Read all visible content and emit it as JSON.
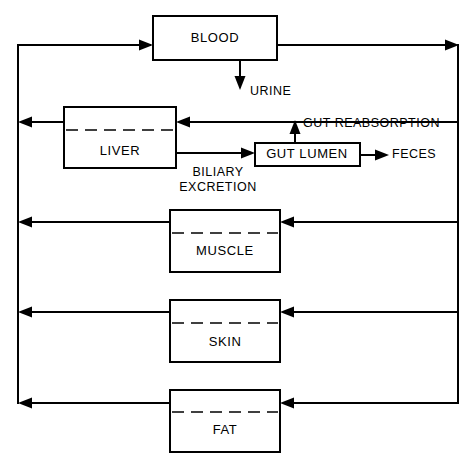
{
  "diagram": {
    "type": "pharmacokinetic-compartment-flow-diagram",
    "accent_color": "#000000",
    "background_color": "#ffffff",
    "compartments": [
      {
        "id": "blood",
        "label": "BLOOD",
        "x": 153,
        "y": 16,
        "w": 124,
        "h": 44,
        "dashed_divider": false,
        "divider_y": 0,
        "label_x": 215,
        "label_y": 38
      },
      {
        "id": "liver",
        "label": "LIVER",
        "x": 64,
        "y": 107,
        "w": 112,
        "h": 61,
        "dashed_divider": true,
        "divider_y": 130,
        "label_x": 120,
        "label_y": 152
      },
      {
        "id": "gut_lumen",
        "label": "GUT LUMEN",
        "x": 255,
        "y": 143,
        "w": 105,
        "h": 23,
        "dashed_divider": false,
        "divider_y": 0,
        "label_x": 307,
        "label_y": 155
      },
      {
        "id": "muscle",
        "label": "MUSCLE",
        "x": 170,
        "y": 210,
        "w": 110,
        "h": 62,
        "dashed_divider": true,
        "divider_y": 233,
        "label_x": 225,
        "label_y": 252
      },
      {
        "id": "skin",
        "label": "SKIN",
        "x": 170,
        "y": 300,
        "w": 110,
        "h": 62,
        "dashed_divider": true,
        "divider_y": 323,
        "label_x": 225,
        "label_y": 343
      },
      {
        "id": "fat",
        "label": "FAT",
        "x": 170,
        "y": 390,
        "w": 110,
        "h": 62,
        "dashed_divider": true,
        "divider_y": 412,
        "label_x": 225,
        "label_y": 431
      }
    ],
    "flow_labels": [
      {
        "id": "urine",
        "text": "URINE",
        "x": 250,
        "y": 91,
        "anchor": "start"
      },
      {
        "id": "gut_reabsorption",
        "text": "GUT REABSORPTION",
        "x": 303,
        "y": 124,
        "anchor": "start"
      },
      {
        "id": "feces",
        "text": "FECES",
        "x": 392,
        "y": 155,
        "anchor": "start"
      },
      {
        "id": "biliary_line_1",
        "text": "BILIARY",
        "x": 218,
        "y": 172,
        "anchor": "middle"
      },
      {
        "id": "biliary_line_2",
        "text": "EXCRETION",
        "x": 218,
        "y": 187,
        "anchor": "middle"
      }
    ],
    "connector_paths": {
      "blood_out_right": "M 277 45 L 458 45",
      "right_bus_down": "M 458 45 L 458 403",
      "left_bus_down": "M 18 45 L 18 403",
      "left_bus_to_blood": "M 18 45 L 153 45",
      "liver_return_left": "M 176 122 L 18 122",
      "liver_in_from_right": "M 176 122 L 458 122",
      "biliary_excretion": "M 176 153 L 255 153",
      "biliary_stub_down": "M 176 122 L 176 153",
      "gut_reabsorption_up": "M 295 143 L 295 122",
      "feces_out": "M 360 155 L 388 155",
      "urine_down": "M 240 60 L 240 88",
      "muscle_return_left": "M 170 222 L 18 222",
      "muscle_in_right": "M 280 222 L 458 222",
      "skin_return_left": "M 170 312 L 18 312",
      "skin_in_right": "M 280 312 L 458 312",
      "fat_return_left": "M 170 403 L 18 403",
      "fat_in_right": "M 280 403 L 458 403"
    }
  }
}
